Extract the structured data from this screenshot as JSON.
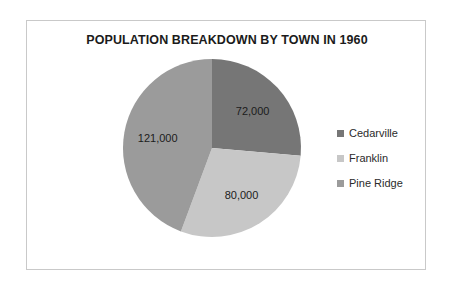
{
  "chart_data": {
    "type": "pie",
    "title": "POPULATION BREAKDOWN BY TOWN IN 1960",
    "categories": [
      "Cedarville",
      "Franklin",
      "Pine Ridge"
    ],
    "values": [
      72000,
      80000,
      121000
    ],
    "labels": [
      "72,000",
      "80,000",
      "121,000"
    ],
    "colors": [
      "#767676",
      "#c7c7c7",
      "#9b9b9b"
    ],
    "total": 273000,
    "start_angle_deg": 0,
    "direction": "clockwise",
    "legend_position": "right",
    "grid": false,
    "xlabel": "",
    "ylabel": ""
  },
  "legend": {
    "items": [
      {
        "label": "Cedarville",
        "color": "#767676"
      },
      {
        "label": "Franklin",
        "color": "#c7c7c7"
      },
      {
        "label": "Pine Ridge",
        "color": "#9b9b9b"
      }
    ]
  }
}
